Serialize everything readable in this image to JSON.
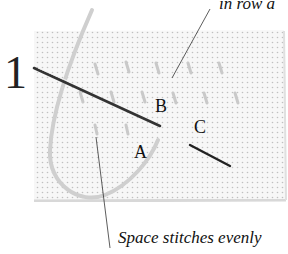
{
  "figure": {
    "step_number": "1",
    "callouts": {
      "top": "in row a",
      "bottom": "Space stitches evenly"
    },
    "points": {
      "a": "A",
      "b": "B",
      "c": "C"
    }
  }
}
